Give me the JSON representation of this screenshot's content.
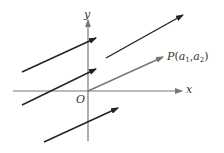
{
  "diagram": {
    "title": "",
    "axes": {
      "x_label": "x",
      "y_label": "y",
      "origin_label": "O",
      "axis_color": "#777777"
    },
    "point": {
      "name": "P",
      "open": "(",
      "a": "a",
      "sub1": "1",
      "comma": ",",
      "sub2": "2",
      "close": ")"
    },
    "vectors": [
      {
        "id": "v1",
        "from": [
          22,
          72
        ],
        "to": [
          96,
          38
        ],
        "color": "#222222"
      },
      {
        "id": "v2",
        "from": [
          106,
          58
        ],
        "to": [
          183,
          15
        ],
        "color": "#222222"
      },
      {
        "id": "v3",
        "from": [
          22,
          105
        ],
        "to": [
          96,
          69
        ],
        "color": "#222222"
      },
      {
        "id": "v-op",
        "from": [
          88,
          91
        ],
        "to": [
          163,
          57
        ],
        "color": "#777777"
      },
      {
        "id": "v5",
        "from": [
          44,
          142
        ],
        "to": [
          118,
          108
        ],
        "color": "#222222"
      }
    ]
  }
}
